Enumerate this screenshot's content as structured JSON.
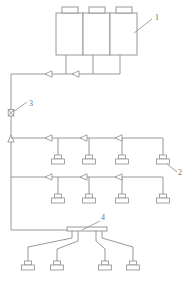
{
  "figure": {
    "width": 190,
    "height": 281,
    "background_color": "#ffffff",
    "line_color": "#8d8d8d"
  },
  "reference_labels": [
    {
      "id": "label-1",
      "text": "1",
      "x": 155,
      "y": 14,
      "refers_to": "storage-vessel-bank"
    },
    {
      "id": "label-3",
      "text": "3",
      "x": 29,
      "y": 104,
      "refers_to": "riser-valve-upper"
    },
    {
      "id": "label-2",
      "text": "2",
      "x": 179,
      "y": 166,
      "refers_to": "nozzle-row1-item4"
    },
    {
      "id": "label-4",
      "text": "4",
      "x": 103,
      "y": 216,
      "refers_to": "bottom-distribution-manifold"
    }
  ],
  "vessels": {
    "count": 3,
    "label": "1",
    "items": [
      {
        "name": "vessel-1",
        "x": 56,
        "y": 13,
        "w": 27,
        "h": 42,
        "cap_x": 62,
        "cap_y": 7,
        "cap_w": 16,
        "cap_h": 6
      },
      {
        "name": "vessel-2",
        "x": 83,
        "y": 13,
        "w": 27,
        "h": 42,
        "cap_x": 89,
        "cap_y": 7,
        "cap_w": 16,
        "cap_h": 6
      },
      {
        "name": "vessel-3",
        "x": 110,
        "y": 13,
        "w": 27,
        "h": 42,
        "cap_x": 116,
        "cap_y": 7,
        "cap_w": 16,
        "cap_h": 6
      }
    ]
  },
  "header_pipe": {
    "name": "vessel-header-pipe",
    "y": 74,
    "x_left": 11,
    "x_right": 120,
    "downcomers_x": [
      66,
      93,
      120
    ],
    "downcomer_top_y": 55,
    "arrow_markers_x": [
      48,
      75
    ],
    "arrow_direction": "left"
  },
  "riser": {
    "name": "main-riser",
    "x": 11,
    "y_top": 74,
    "y_bottom": 230,
    "valves": [
      {
        "name": "riser-valve-upper",
        "y": 113,
        "label": "3"
      },
      {
        "name": "riser-valve-lower",
        "y": 137,
        "label": ""
      }
    ]
  },
  "branch_rows": [
    {
      "name": "branch-row-1",
      "pipe_y": 138,
      "x_left": 11,
      "x_right": 163,
      "arrow_markers_x": [
        45,
        80,
        115
      ],
      "arrow_direction": "left",
      "nozzles": [
        {
          "name": "nozzle-row1-item1",
          "x": 58,
          "drop_y": 155
        },
        {
          "name": "nozzle-row1-item2",
          "x": 89,
          "drop_y": 155
        },
        {
          "name": "nozzle-row1-item3",
          "x": 122,
          "drop_y": 155
        },
        {
          "name": "nozzle-row1-item4",
          "x": 163,
          "drop_y": 155
        }
      ]
    },
    {
      "name": "branch-row-2",
      "pipe_y": 177,
      "x_left": 11,
      "x_right": 163,
      "arrow_markers_x": [
        45,
        80,
        115
      ],
      "arrow_direction": "left",
      "nozzles": [
        {
          "name": "nozzle-row2-item1",
          "x": 58,
          "drop_y": 194
        },
        {
          "name": "nozzle-row2-item2",
          "x": 89,
          "drop_y": 194
        },
        {
          "name": "nozzle-row2-item3",
          "x": 122,
          "drop_y": 194
        },
        {
          "name": "nozzle-row2-item4",
          "x": 163,
          "drop_y": 194
        }
      ]
    }
  ],
  "bottom_manifold": {
    "name": "bottom-distribution-manifold",
    "label": "4",
    "bar_x": 67,
    "bar_y": 227,
    "bar_w": 40,
    "bar_h": 4,
    "feed_y": 230,
    "feed_x_from": 11,
    "nozzles": [
      {
        "name": "nozzle-bottom-item1",
        "x": 28,
        "tap_x": 72,
        "nozzle_y": 268
      },
      {
        "name": "nozzle-bottom-item2",
        "x": 57,
        "tap_x": 78,
        "nozzle_y": 268
      },
      {
        "name": "nozzle-bottom-item3",
        "x": 105,
        "tap_x": 95,
        "nozzle_y": 268
      },
      {
        "name": "nozzle-bottom-item4",
        "x": 133,
        "tap_x": 101,
        "nozzle_y": 268
      }
    ]
  },
  "nozzle_shape": {
    "stem_h": 7,
    "base_w": 13,
    "base_h": 5,
    "top_w": 7,
    "top_h": 4
  }
}
